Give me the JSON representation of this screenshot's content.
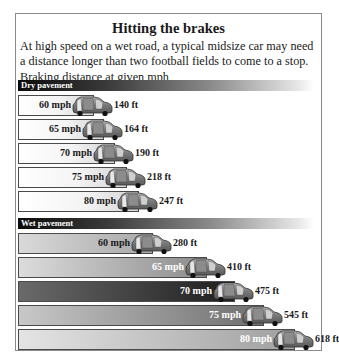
{
  "header": {
    "title": "Hitting the brakes",
    "intro": "At high speed on a wet road, a typical midsize car may need a distance longer than two football fields to come to a stop.",
    "subhead": "Braking distance at given mph"
  },
  "sections": {
    "dry": {
      "label": "Dry pavement"
    },
    "wet": {
      "label": "Wet pavement"
    }
  },
  "chart_data": {
    "type": "bar",
    "title": "Hitting the brakes",
    "subtitle": "Braking distance at given mph",
    "xlabel": "",
    "ylabel": "",
    "categories": [
      "60 mph",
      "65 mph",
      "70 mph",
      "75 mph",
      "80 mph"
    ],
    "series": [
      {
        "name": "Dry pavement",
        "values": [
          140,
          164,
          190,
          218,
          247
        ],
        "labels": [
          "140 ft",
          "164 ft",
          "190 ft",
          "218 ft",
          "247 ft"
        ]
      },
      {
        "name": "Wet pavement",
        "values": [
          280,
          410,
          475,
          545,
          618
        ],
        "labels": [
          "280 ft",
          "410 ft",
          "475 ft",
          "545 ft",
          "618 ft"
        ]
      }
    ],
    "orientation": "horizontal",
    "units": "ft",
    "legend": "section headers (Dry pavement, Wet pavement)",
    "grid": false
  },
  "icons": {
    "bar_end": "car-icon"
  },
  "colors": {
    "section_header_dark": "#0a0a0a",
    "bar_border": "#4a4a4a",
    "car_body": "#7a7a7a",
    "wet_row_fills": [
      [
        "#d9d9d9",
        "#a8a8a8"
      ],
      [
        "#dcdcdc",
        "#8c8c8c"
      ],
      [
        "#6a6a6a",
        "#1e1e1e"
      ],
      [
        "#c8c8c8",
        "#6e6e6e"
      ],
      [
        "#e4e4e4",
        "#a0a0a0"
      ]
    ],
    "wet_label_colors": [
      "#1a1a1a",
      "#ffffff",
      "#ffffff",
      "#ffffff",
      "#ffffff"
    ]
  }
}
